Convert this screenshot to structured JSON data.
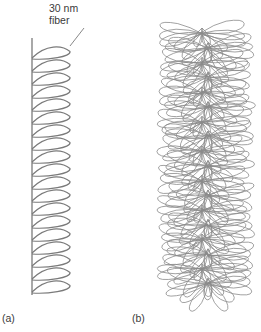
{
  "figure": {
    "callout_label_line1": "30 nm",
    "callout_label_line2": "fiber",
    "panel_a_label": "(a)",
    "panel_b_label": "(b)"
  },
  "panel_a": {
    "description": "single 30 nm fiber folded into loops along a vertical scaffold",
    "axis_x": 32,
    "axis_top": 38,
    "axis_bottom": 295,
    "loop_count": 19,
    "loop_first_y": 46,
    "loop_spacing": 13,
    "loop_extent_x": 70,
    "stroke_color": "#7a7a7a"
  },
  "panel_b": {
    "description": "radial loops of fiber arranged around a central axis",
    "center_x": 205,
    "top_y": 20,
    "bottom_y": 305,
    "left_x": 158,
    "right_x": 256,
    "stroke_color": "#8a8a8a"
  }
}
